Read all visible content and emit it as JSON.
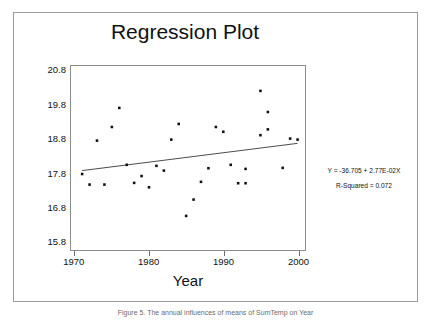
{
  "figure": {
    "title": "Regression Plot",
    "caption": "Figure 5. The annual influences of means of SumTemp on Year"
  },
  "annotation": {
    "equation": "Y = -36.705 + 2.77E-02X",
    "r_squared": "R-Squared = 0.072"
  },
  "chart_data": {
    "type": "scatter",
    "title": "Regression Plot",
    "xlabel": "Year",
    "ylabel": "SumTemp",
    "xlim": [
      1969.5,
      2001.0
    ],
    "ylim": [
      15.55,
      20.95
    ],
    "xticks": [
      "1970",
      "1980",
      "1990",
      "2000"
    ],
    "xtick_values": [
      1970,
      1980,
      1990,
      2000
    ],
    "yticks": [
      "20.8",
      "19.8",
      "18.8",
      "17.8",
      "16.8",
      "15.8"
    ],
    "ytick_values": [
      20.8,
      19.8,
      18.8,
      17.8,
      16.8,
      15.8
    ],
    "grid": false,
    "legend": false,
    "marker": "square",
    "marker_color": "#111111",
    "line_color": "#4a4a4a",
    "points": [
      {
        "x": 1971,
        "y": 17.78
      },
      {
        "x": 1972,
        "y": 17.47
      },
      {
        "x": 1973,
        "y": 18.76
      },
      {
        "x": 1974,
        "y": 17.47
      },
      {
        "x": 1975,
        "y": 19.16
      },
      {
        "x": 1976,
        "y": 19.72
      },
      {
        "x": 1977,
        "y": 18.05
      },
      {
        "x": 1978,
        "y": 17.52
      },
      {
        "x": 1979,
        "y": 17.72
      },
      {
        "x": 1980,
        "y": 17.39
      },
      {
        "x": 1981,
        "y": 18.02
      },
      {
        "x": 1982,
        "y": 17.88
      },
      {
        "x": 1983,
        "y": 18.79
      },
      {
        "x": 1984,
        "y": 19.25
      },
      {
        "x": 1985,
        "y": 16.55
      },
      {
        "x": 1986,
        "y": 17.03
      },
      {
        "x": 1987,
        "y": 17.55
      },
      {
        "x": 1988,
        "y": 17.95
      },
      {
        "x": 1989,
        "y": 19.16
      },
      {
        "x": 1990,
        "y": 19.02
      },
      {
        "x": 1991,
        "y": 18.05
      },
      {
        "x": 1992,
        "y": 17.51
      },
      {
        "x": 1993,
        "y": 17.51
      },
      {
        "x": 1993,
        "y": 17.93
      },
      {
        "x": 1995,
        "y": 20.22
      },
      {
        "x": 1995,
        "y": 18.92
      },
      {
        "x": 1996,
        "y": 19.6
      },
      {
        "x": 1996,
        "y": 19.09
      },
      {
        "x": 1998,
        "y": 17.96
      },
      {
        "x": 1999,
        "y": 18.82
      },
      {
        "x": 2000,
        "y": 18.79
      }
    ],
    "regression_line": {
      "equation": "Y = -36.705 + 2.77E-02X",
      "intercept": -36.705,
      "slope": 0.0277,
      "r_squared": 0.072,
      "x_start": 1971,
      "y_start": 17.88,
      "x_end": 2000,
      "y_end": 18.68
    }
  }
}
